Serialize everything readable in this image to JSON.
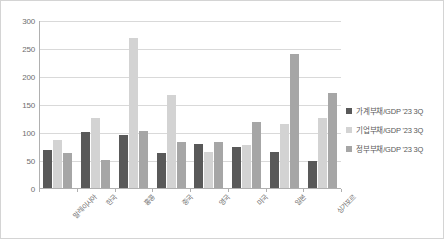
{
  "chart_data": {
    "type": "bar",
    "title": "",
    "subtitle": "",
    "xlabel": "",
    "ylabel": "",
    "ylim": [
      0,
      300
    ],
    "ytick_step": 50,
    "yticks": [
      0,
      50,
      100,
      150,
      200,
      250,
      300
    ],
    "grid": true,
    "legend_position": "right",
    "categories": [
      "말레이시아",
      "한국",
      "홍콩",
      "중국",
      "영국",
      "미국",
      "일본",
      "싱가포르"
    ],
    "series": [
      {
        "name": "가계부채/GDP '23 3Q",
        "color": "#595959",
        "values": [
          67,
          100,
          95,
          63,
          78,
          73,
          64,
          48
        ]
      },
      {
        "name": "기업부채/GDP '23 3Q",
        "color": "#d3d3d3",
        "values": [
          86,
          125,
          267,
          166,
          65,
          76,
          115,
          125
        ]
      },
      {
        "name": "정부부채/GDP '23 3Q",
        "color": "#a6a6a6",
        "values": [
          63,
          50,
          102,
          83,
          83,
          117,
          240,
          170
        ]
      }
    ]
  },
  "legend": {
    "items": [
      {
        "label": "가계부채/GDP '23 3Q",
        "swatch": "legend-swatch-household"
      },
      {
        "label": "기업부채/GDP '23 3Q",
        "swatch": "legend-swatch-corporate"
      },
      {
        "label": "정부부채/GDP '23 3Q",
        "swatch": "legend-swatch-government"
      }
    ]
  }
}
